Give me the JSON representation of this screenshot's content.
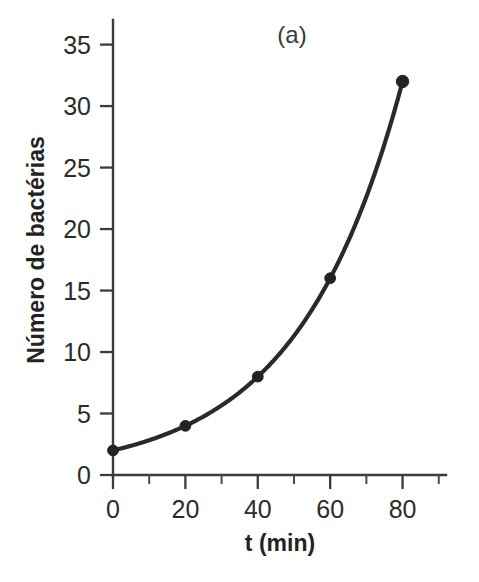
{
  "chart_data": {
    "type": "line",
    "title": "",
    "panel_label": "(a)",
    "xlabel": "t (min)",
    "ylabel": "Número de bactérias",
    "x": [
      0,
      20,
      40,
      60,
      80
    ],
    "values": [
      2,
      4,
      8,
      16,
      32
    ],
    "series": [
      {
        "name": "Número de bactérias",
        "x": [
          0,
          20,
          40,
          60,
          80
        ],
        "values": [
          2,
          4,
          8,
          16,
          32
        ]
      }
    ],
    "xlim": [
      0,
      92
    ],
    "ylim": [
      0,
      37
    ],
    "xticks": [
      0,
      20,
      40,
      60,
      80
    ],
    "xticklabels": [
      "0",
      "20",
      "40",
      "60",
      "80"
    ],
    "x_minor_ticks": [
      10,
      30,
      50,
      70,
      90
    ],
    "yticks": [
      0,
      5,
      10,
      15,
      20,
      25,
      30,
      35
    ],
    "yticklabels": [
      "0",
      "5",
      "10",
      "15",
      "20",
      "25",
      "30",
      "35"
    ],
    "grid": false,
    "legend": false,
    "legend_position": "none",
    "marker": "circle",
    "line_color": "#2a2a2a",
    "marker_color": "#232323",
    "background_color": "#ffffff",
    "annotations": []
  }
}
